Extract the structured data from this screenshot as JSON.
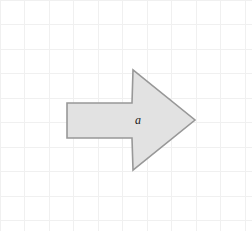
{
  "figure": {
    "canvas": {
      "width": 252,
      "height": 231,
      "background_color": "#ffffff"
    },
    "grid": {
      "visible": true,
      "spacing_px": 24.5,
      "line_color": "#f0f0f0",
      "line_width_px": 1,
      "vertical_lines": [
        0,
        24.5,
        49,
        73.5,
        98,
        122.5,
        147,
        171.5,
        196,
        220.5,
        245
      ],
      "horizontal_lines": [
        0,
        24.5,
        49,
        73.5,
        98,
        122.5,
        147,
        171.5,
        196,
        220.5
      ]
    },
    "shape": {
      "name": "right-pointing-block-arrow",
      "kind": "polygon",
      "fill_color": "#e2e2e2",
      "stroke_color": "#989898",
      "stroke_width_px": 1.6,
      "direction": "right",
      "points": "67,103 132,103 133,70 195,120 133,170 132,138 67,138",
      "vertices": [
        {
          "name": "body-top-left",
          "x": 67,
          "y": 103
        },
        {
          "name": "notch-top",
          "x": 132,
          "y": 103
        },
        {
          "name": "head-top",
          "x": 133,
          "y": 70
        },
        {
          "name": "tip",
          "x": 195,
          "y": 120
        },
        {
          "name": "head-bottom",
          "x": 133,
          "y": 170
        },
        {
          "name": "notch-bottom",
          "x": 132,
          "y": 138
        },
        {
          "name": "body-bottom-left",
          "x": 67,
          "y": 138
        }
      ],
      "label": {
        "text": "a",
        "x": 138,
        "y": 120,
        "color": "#1a1a1a",
        "style": "italic"
      }
    }
  }
}
